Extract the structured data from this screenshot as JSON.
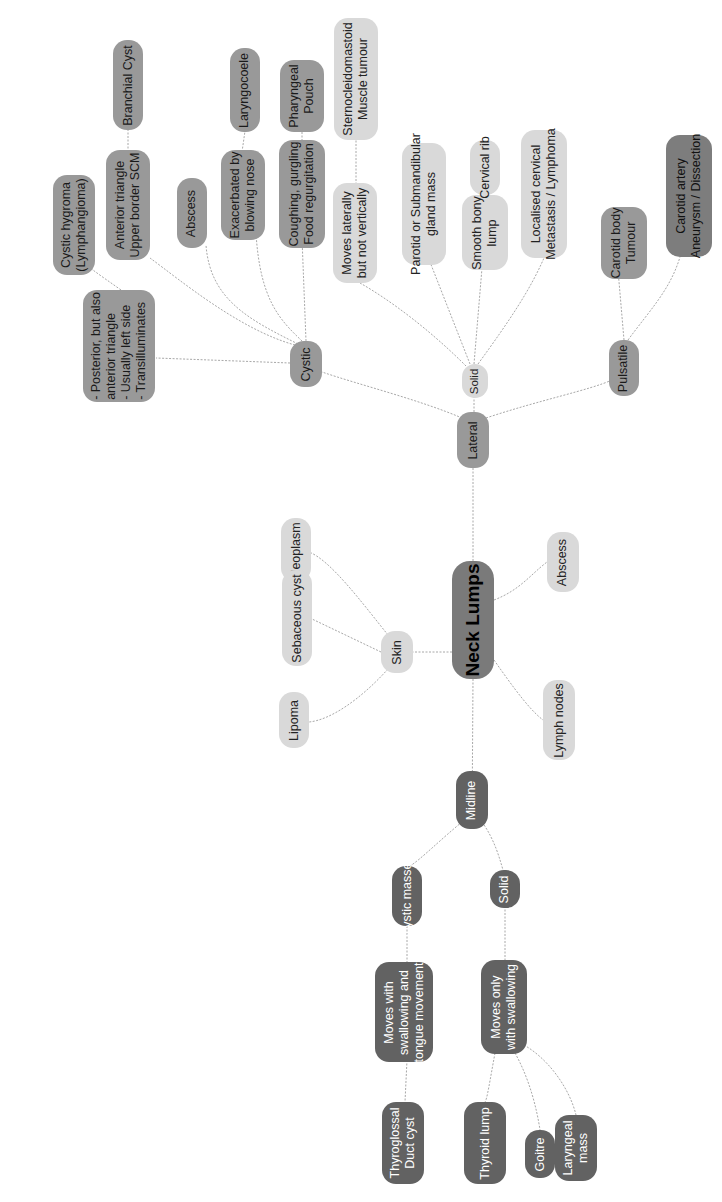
{
  "title": "Neck Lumps",
  "colors": {
    "light": "#d9d9d9",
    "mid": "#999999",
    "dark": "#626262",
    "root": "#7a7a7a",
    "link": "#aaaaaa"
  },
  "nodes": {
    "root": "Neck Lumps",
    "lateral": "Lateral",
    "midline": "Midline",
    "skin": "Skin",
    "skin_neoplasm": "Neoplasm",
    "skin_sebaceous": "Sebaceous cyst",
    "skin_lipoma": "Lipoma",
    "abscess": "Abscess",
    "lymph_nodes": "Lymph nodes",
    "lat_cystic": "Cystic",
    "lat_solid": "Solid",
    "lat_pulsatile": "Pulsatile",
    "cys_posterior": "- Posterior, but also\nanterior triangle\n- Usually left side\n- Transilluminates",
    "cys_hygroma": "Cystic hygroma\n(Lymphangioma)",
    "cys_anterior": "Anterior triangle\nUpper border SCM",
    "cys_branchial": "Branchial Cyst",
    "cys_abscess": "Abscess",
    "cys_exacerbated": "Exacerbated by\nblowing nose",
    "cys_laryngocoele": "Laryngocoele",
    "cys_coughing": "Coughing, gurgling\nFood regurgitation",
    "cys_pharyngeal": "Pharyngeal\nPouch",
    "sol_moves_lat": "Moves laterally\nbut not vertically",
    "sol_scm": "Sternocleidomastoid\nMuscle tumour",
    "sol_parotid": "Parotid or Submandibular\ngland mass",
    "sol_bony": "Smooth bony\nlump",
    "sol_cervical_rib": "Cervical rib",
    "sol_localised": "Localised cervical\nMetastasis / Lymphoma",
    "pul_carotid_body": "Carotid body\nTumour",
    "pul_carotid_artery": "Carotid artery\nAneurysm / Dissection",
    "mid_cystic": "Cystic masses",
    "mid_solid": "Solid",
    "mid_moves_tongue": "Moves with\nswallowing and\ntongue movement",
    "mid_thyroglossal": "Thyroglossal\nDuct cyst",
    "mid_moves_only": "Moves only\nwith swallowing",
    "mid_thyroid_lump": "Thyroid lump",
    "mid_goitre": "Goitre",
    "mid_laryngeal": "Laryngeal\nmass"
  }
}
